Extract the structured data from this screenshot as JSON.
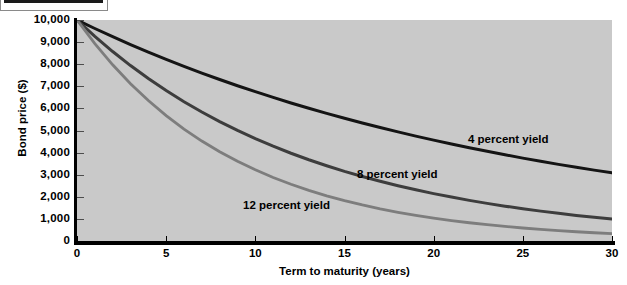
{
  "header": {
    "tab_fill_color": "#1a1a1a",
    "tab_border_color": "#8a8a8a"
  },
  "chart_data": {
    "type": "line",
    "title": "",
    "xlabel": "Term to maturity (years)",
    "ylabel": "Bond price ($)",
    "xlim": [
      0,
      30
    ],
    "ylim": [
      0,
      10000
    ],
    "grid": false,
    "legend_position": "inline-annotations",
    "plot_background": "#c9c9c9",
    "x_ticks": [
      "0",
      "5",
      "10",
      "15",
      "20",
      "25",
      "30"
    ],
    "x_tick_values": [
      0,
      5,
      10,
      15,
      20,
      25,
      30
    ],
    "y_ticks": [
      "0",
      "1,000",
      "2,000",
      "3,000",
      "4,000",
      "5,000",
      "6,000",
      "7,000",
      "8,000",
      "9,000",
      "10,000"
    ],
    "y_tick_values": [
      0,
      1000,
      2000,
      3000,
      4000,
      5000,
      6000,
      7000,
      8000,
      9000,
      10000
    ],
    "x": [
      0,
      1,
      2,
      3,
      4,
      5,
      6,
      7,
      8,
      9,
      10,
      11,
      12,
      13,
      14,
      15,
      16,
      17,
      18,
      19,
      20,
      21,
      22,
      23,
      24,
      25,
      26,
      27,
      28,
      29,
      30
    ],
    "series": [
      {
        "name": "4 percent yield",
        "label": "4 percent yield",
        "color": "#141414",
        "values": [
          10000,
          9615,
          9246,
          8890,
          8548,
          8219,
          7903,
          7599,
          7307,
          7026,
          6756,
          6496,
          6246,
          6006,
          5775,
          5553,
          5339,
          5134,
          4936,
          4746,
          4564,
          4388,
          4220,
          4057,
          3901,
          3751,
          3607,
          3468,
          3335,
          3207,
          3083
        ]
      },
      {
        "name": "8 percent yield",
        "label": "8 percent yield",
        "color": "#3d3d3d",
        "values": [
          10000,
          9259,
          8573,
          7938,
          7350,
          6806,
          6302,
          5835,
          5403,
          5002,
          4632,
          4289,
          3971,
          3677,
          3405,
          3152,
          2919,
          2703,
          2502,
          2317,
          2145,
          1987,
          1839,
          1703,
          1577,
          1460,
          1352,
          1252,
          1159,
          1073,
          994
        ]
      },
      {
        "name": "12 percent yield",
        "label": "12 percent yield",
        "color": "#7d7d7d",
        "values": [
          10000,
          8929,
          7972,
          7118,
          6355,
          5674,
          5066,
          4523,
          4039,
          3606,
          3220,
          2875,
          2567,
          2292,
          2046,
          1827,
          1631,
          1456,
          1300,
          1161,
          1037,
          926,
          826,
          738,
          659,
          588,
          525,
          469,
          419,
          374,
          334
        ]
      }
    ]
  }
}
